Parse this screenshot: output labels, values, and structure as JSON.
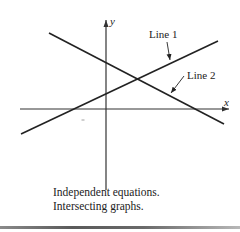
{
  "figure": {
    "axes": {
      "x_label": "x",
      "y_label": "y",
      "origin": [
        106,
        109
      ],
      "x_axis": {
        "from": [
          20,
          109
        ],
        "to": [
          229,
          109
        ]
      },
      "y_axis": {
        "from": [
          106,
          190
        ],
        "to": [
          106,
          20
        ]
      }
    },
    "lines": [
      {
        "name": "Line 1",
        "label": "Line 1",
        "from": [
          21,
          134
        ],
        "to": [
          218,
          41
        ],
        "label_pos": [
          149,
          29
        ],
        "pointer": {
          "from": [
            167,
            42
          ],
          "to": [
            170,
            60
          ]
        }
      },
      {
        "name": "Line 2",
        "label": "Line 2",
        "from": [
          49,
          33
        ],
        "to": [
          224,
          124
        ],
        "label_pos": [
          187,
          70
        ],
        "pointer": {
          "from": [
            184,
            76
          ],
          "to": [
            171,
            93
          ]
        }
      }
    ],
    "intersection": [
      137,
      79
    ],
    "tick_mark": [
      83,
      120
    ],
    "colors": {
      "line": "#222222",
      "axis": "#333333",
      "background": "#ffffff"
    }
  },
  "caption": {
    "line1": "Independent equations.",
    "line2": "Intersecting graphs."
  }
}
